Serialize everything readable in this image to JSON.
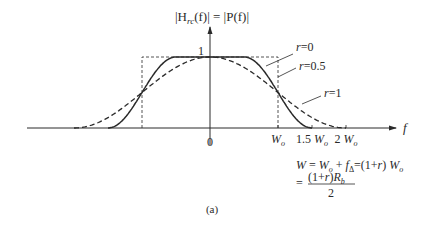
{
  "title": {
    "lhs": "|H",
    "lhs_sub": "rc",
    "lhs_tail": "(f)| = |P(f)|"
  },
  "axis": {
    "x_label": "f",
    "origin_label": "0",
    "peak_label": "1",
    "ticks": [
      {
        "value": 1.0,
        "label": "W",
        "sub": "o"
      },
      {
        "value": 1.5,
        "label": "1.5 W",
        "sub": "o"
      },
      {
        "value": 2.0,
        "label": "2 W",
        "sub": "o"
      }
    ]
  },
  "curves": [
    {
      "name": "r=0",
      "label": "r = 0",
      "rolloff": 0,
      "style": "dashed-thin"
    },
    {
      "name": "r=0.5",
      "label": "r = 0.5",
      "rolloff": 0.5,
      "style": "solid"
    },
    {
      "name": "r=1",
      "label": "r = 1",
      "rolloff": 1,
      "style": "dashed"
    }
  ],
  "equation": {
    "line1": "W = Wₒ + fΔ = (1 + r) Wₒ",
    "line2_eq": "=",
    "line2_num": "(1 + r) R",
    "line2_num_sub": "b",
    "line2_den": "2"
  },
  "caption": "(a)"
}
